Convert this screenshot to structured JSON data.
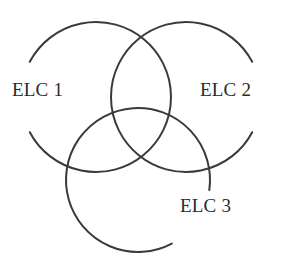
{
  "figure": {
    "type": "venn-diagram",
    "set_count": 3,
    "stroke_color": "#3a3a3a",
    "text_color": "#2b2b2b",
    "background_color": "#ffffff"
  },
  "sets": [
    {
      "id": "elc1",
      "label": "ELC 1",
      "center_x": 96,
      "center_y": 97,
      "radius": 75,
      "gap_start_deg": 152,
      "gap_end_deg": 208
    },
    {
      "id": "elc2",
      "label": "ELC 2",
      "center_x": 186,
      "center_y": 97,
      "radius": 75,
      "gap_start_deg": -28,
      "gap_end_deg": 28
    },
    {
      "id": "elc3",
      "label": "ELC 3",
      "center_x": 138,
      "center_y": 180,
      "radius": 72,
      "gap_start_deg": 8,
      "gap_end_deg": 62
    }
  ],
  "chart_data": {
    "type": "venn",
    "title": "",
    "xlabel": "",
    "ylabel": "",
    "set_labels": [
      "ELC 1",
      "ELC 2",
      "ELC 3"
    ],
    "circles": [
      {
        "label": "ELC 1",
        "cx": 96,
        "cy": 97,
        "r": 75
      },
      {
        "label": "ELC 2",
        "cx": 186,
        "cy": 97,
        "r": 75
      },
      {
        "label": "ELC 3",
        "cx": 138,
        "cy": 180,
        "r": 72
      }
    ],
    "regions": [],
    "values": [],
    "legend_position": "inline",
    "grid": false
  }
}
